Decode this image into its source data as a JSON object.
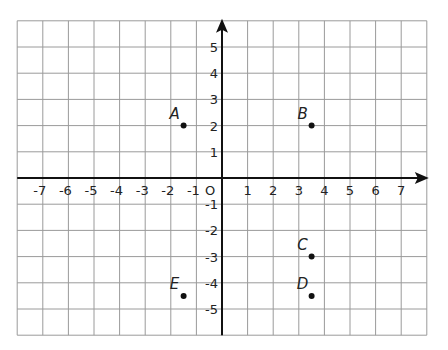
{
  "chart_data": {
    "type": "scatter",
    "title": "",
    "xlabel": "",
    "ylabel": "",
    "xlim": [
      -8,
      8
    ],
    "ylim": [
      -6,
      6
    ],
    "grid": true,
    "x_ticks": [
      "-7",
      "-6",
      "-5",
      "-4",
      "-3",
      "-2",
      "-1",
      "1",
      "2",
      "3",
      "4",
      "5",
      "6",
      "7"
    ],
    "y_ticks": [
      "5",
      "4",
      "3",
      "2",
      "1",
      "-1",
      "-2",
      "-3",
      "-4",
      "-5"
    ],
    "origin_label": "O",
    "points": [
      {
        "label": "A",
        "x": -1.5,
        "y": 2
      },
      {
        "label": "B",
        "x": 3.5,
        "y": 2
      },
      {
        "label": "C",
        "x": 3.5,
        "y": -3
      },
      {
        "label": "D",
        "x": 3.5,
        "y": -4.5
      },
      {
        "label": "E",
        "x": -1.5,
        "y": -4.5
      }
    ]
  },
  "colors": {
    "grid": "#9a9a9a",
    "axis": "#111111",
    "point": "#111111"
  }
}
